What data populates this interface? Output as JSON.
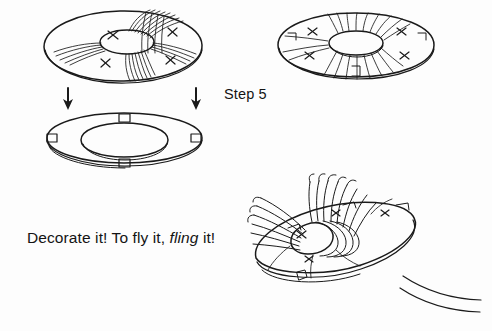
{
  "page": {
    "background_color": "#fdfdfd",
    "ink_color": "#1a1a1a",
    "width": 492,
    "height": 331
  },
  "labels": {
    "step": "Step 5",
    "caption_part1": "Decorate it! To fly it, ",
    "caption_emphasis": "fling",
    "caption_part2": " it!"
  },
  "figures": [
    {
      "name": "fringed-disc-top-left",
      "description": "Ring disc seen at a low angle with long fringe bundles sweeping outward and four hand-drawn X marks on the quadrants",
      "x_marks": 4,
      "has_fringe": true,
      "has_notches": false
    },
    {
      "name": "plain-ring-middle-left",
      "description": "Plain flat ring (donut) shown from a raised angle with four small rectangular notch tabs at top, bottom, left and right",
      "x_marks": 0,
      "has_fringe": false,
      "has_notches": true,
      "notch_count": 4
    },
    {
      "name": "fringed-disc-top-right",
      "description": "Ring disc seen nearly flat from above with radiating striped fringe bundles, four X marks and small square notches",
      "x_marks": 4,
      "has_fringe": true,
      "has_notches": true,
      "notch_count": 4
    },
    {
      "name": "gathered-disc-bottom-right",
      "description": "Ring disc with fringes gathered and bound into a bunched bundle across the centre, X marks and notches visible on the rim",
      "x_marks": 4,
      "has_fringe": true,
      "has_notches": true,
      "notch_count": 3
    }
  ],
  "arrows": [
    {
      "name": "arrow-left",
      "direction": "down"
    },
    {
      "name": "arrow-right",
      "direction": "down"
    }
  ],
  "motion_lines": {
    "name": "motion-lines",
    "count": 2,
    "description": "Two curved speed lines in the lower right corner suggesting flight"
  }
}
